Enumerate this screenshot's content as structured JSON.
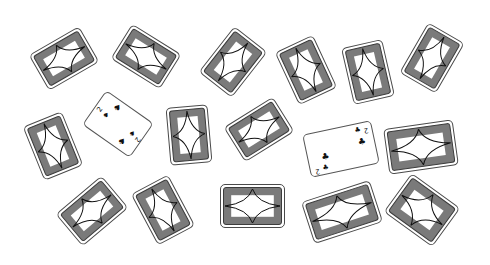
{
  "game": {
    "title": "Card table",
    "colors": {
      "table": "#ffffff",
      "card_back": "#7a7a7a",
      "card_outline": "#3c3c3c",
      "card_face": "#ffffff",
      "ink": "#111111"
    }
  },
  "cards": [
    {
      "id": "card-1",
      "face": "down"
    },
    {
      "id": "card-2",
      "face": "down"
    },
    {
      "id": "card-3",
      "face": "down"
    },
    {
      "id": "card-4",
      "face": "down"
    },
    {
      "id": "card-5",
      "face": "down"
    },
    {
      "id": "card-6",
      "face": "down"
    },
    {
      "id": "card-7",
      "face": "down"
    },
    {
      "id": "card-8",
      "face": "up",
      "rank": "2",
      "suit": "spades",
      "suit_symbol": "♠"
    },
    {
      "id": "card-9",
      "face": "down"
    },
    {
      "id": "card-10",
      "face": "down"
    },
    {
      "id": "card-11",
      "face": "up",
      "rank": "2",
      "suit": "clubs",
      "suit_symbol": "♣"
    },
    {
      "id": "card-12",
      "face": "down"
    },
    {
      "id": "card-13",
      "face": "down"
    },
    {
      "id": "card-14",
      "face": "down"
    },
    {
      "id": "card-15",
      "face": "down"
    },
    {
      "id": "card-16",
      "face": "down"
    },
    {
      "id": "card-17",
      "face": "down"
    }
  ]
}
